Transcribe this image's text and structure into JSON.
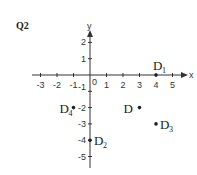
{
  "question_label": "Q2",
  "chart_data": {
    "type": "scatter",
    "title": "",
    "xlabel": "x",
    "ylabel": "y",
    "xlim": [
      -3,
      5
    ],
    "ylim": [
      -5,
      2
    ],
    "grid": false,
    "x_ticks": [
      -3,
      -2,
      -1,
      0,
      1,
      2,
      3,
      4,
      5
    ],
    "y_ticks": [
      2,
      1,
      -1,
      -2,
      -3,
      -4,
      -5
    ],
    "origin_label": "0",
    "points": [
      {
        "label": "D",
        "sub": "1",
        "x": 4,
        "y": 0
      },
      {
        "label": "D",
        "sub": "2",
        "x": 0,
        "y": -4
      },
      {
        "label": "D",
        "sub": "3",
        "x": 4,
        "y": -3
      },
      {
        "label": "D",
        "sub": "4",
        "x": -1,
        "y": -2
      },
      {
        "label": "D",
        "sub": "",
        "x": 3,
        "y": -2
      }
    ]
  }
}
